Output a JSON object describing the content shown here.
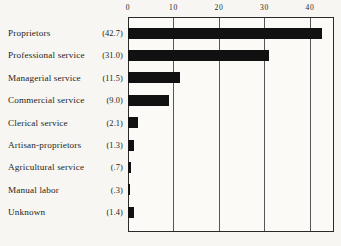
{
  "chart_data": {
    "type": "bar",
    "orientation": "horizontal",
    "title": "",
    "xlabel": "",
    "ylabel": "",
    "xlim": [
      0,
      45.3
    ],
    "xticks": [
      0,
      10,
      20,
      30,
      40
    ],
    "xtick_labels": [
      "0",
      "10",
      "20",
      "30",
      "40"
    ],
    "grid": true,
    "axis_position": "top",
    "legend": "none",
    "categories": [
      "Proprietors",
      "Professional service",
      "Managerial service",
      "Commercial service",
      "Clerical service",
      "Artisan-proprietors",
      "Agricultural service",
      "Manual labor",
      "Unknown"
    ],
    "values": [
      42.7,
      31.0,
      11.5,
      9.0,
      2.1,
      1.3,
      0.7,
      0.3,
      1.4
    ],
    "value_labels": [
      "(42.7)",
      "(31.0)",
      "(11.5)",
      "(9.0)",
      "(2.1)",
      "(1.3)",
      "(.7)",
      "(.3)",
      "(1.4)"
    ],
    "bar_color": "#111111",
    "grid_color": "#55555a",
    "frame_color": "#2a2a2a",
    "background_color": "#f7f6f2"
  }
}
